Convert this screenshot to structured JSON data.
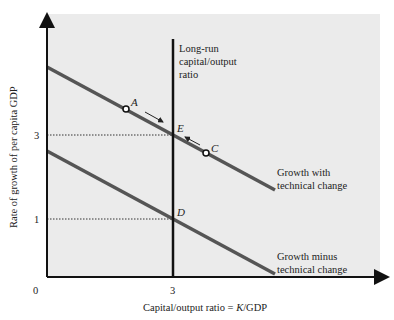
{
  "figure": {
    "panel_color": "#ebebeb",
    "line_color": "#555555",
    "axis_color": "#111111"
  },
  "axes": {
    "x_label_prefix": "Capital/output ratio = ",
    "x_label_var": "K",
    "x_label_suffix": "/GDP",
    "y_label": "Rate of growth of per capita GDP",
    "origin_label": "0",
    "x_ticks": [
      {
        "value": 3,
        "label": "3"
      }
    ],
    "y_ticks": [
      {
        "value": 3,
        "label": "3"
      },
      {
        "value": 1,
        "label": "1"
      }
    ]
  },
  "vertical_line": {
    "label_lines": [
      "Long-run",
      "capital/output",
      "ratio"
    ]
  },
  "curves": {
    "upper": {
      "label_lines": [
        "Growth with",
        "technical change"
      ]
    },
    "lower": {
      "label_lines": [
        "Growth minus",
        "technical change"
      ]
    }
  },
  "points": {
    "A": "A",
    "E": "E",
    "C": "C",
    "D": "D"
  }
}
